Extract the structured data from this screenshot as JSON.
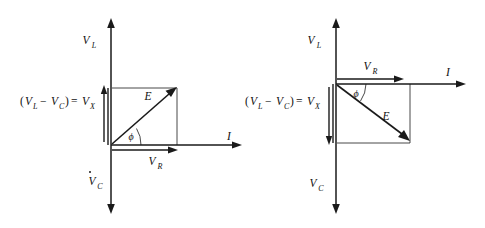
{
  "figure": {
    "type": "phasor-diagram-pair",
    "background": "#ffffff",
    "ink": "#1a1a1a",
    "width": 485,
    "height": 228
  },
  "diagrams": [
    {
      "id": "inductive",
      "caption_none": "",
      "axes": {
        "vertical_up_label": "V",
        "vertical_up_sub": "L",
        "vertical_down_label": "V",
        "vertical_down_sub": "C",
        "horizontal_label": "I"
      },
      "reactance_label": {
        "open_paren": "(",
        "v1": "V",
        "v1_sub": "L",
        "minus": "−",
        "v2": "V",
        "v2_sub": "C",
        "close_paren": ")",
        "equals": "=",
        "result": "V",
        "result_sub": "X"
      },
      "vectors": [
        {
          "name": "E",
          "label": "E",
          "description": "resultant voltage phasor, up-right"
        },
        {
          "name": "VR",
          "label": "V",
          "sub": "R",
          "description": "resistive voltage phasor along I axis"
        },
        {
          "name": "VX",
          "label": "V",
          "sub": "X",
          "description": "net reactive voltage, upward"
        }
      ],
      "angle_label": "ϕ",
      "geometry": {
        "origin": [
          111,
          145
        ],
        "rect_right": 177,
        "rect_top": 88,
        "y_axis_top": 22,
        "y_axis_bottom": 212,
        "x_axis_right": 240
      }
    },
    {
      "id": "capacitive",
      "axes": {
        "vertical_up_label": "V",
        "vertical_up_sub": "L",
        "vertical_down_label": "V",
        "vertical_down_sub": "C",
        "horizontal_label": "I"
      },
      "reactance_label": {
        "open_paren": "(",
        "v1": "V",
        "v1_sub": "L",
        "minus": "−",
        "v2": "V",
        "v2_sub": "C",
        "close_paren": ")",
        "equals": "=",
        "result": "V",
        "result_sub": "X"
      },
      "vectors": [
        {
          "name": "E",
          "label": "E",
          "description": "resultant voltage phasor, down-right"
        },
        {
          "name": "VR",
          "label": "V",
          "sub": "R",
          "description": "resistive voltage phasor along I axis"
        },
        {
          "name": "VX",
          "label": "V",
          "sub": "X",
          "description": "net reactive voltage, downward"
        }
      ],
      "angle_label": "ϕ",
      "geometry": {
        "origin": [
          336,
          84
        ],
        "rect_right": 410,
        "rect_bottom": 143,
        "y_axis_top": 18,
        "y_axis_bottom": 212,
        "x_axis_right": 466
      }
    }
  ]
}
